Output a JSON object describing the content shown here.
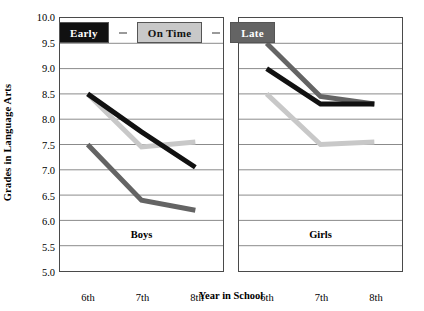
{
  "chart_data": {
    "type": "line",
    "title": "",
    "xlabel": "Year in School",
    "ylabel": "Grades in Language Arts",
    "categories": [
      "6th",
      "7th",
      "8th"
    ],
    "ylim": [
      5.0,
      10.0
    ],
    "yticks": [
      "5.0",
      "5.5",
      "6.0",
      "6.5",
      "7.0",
      "7.5",
      "8.0",
      "8.5",
      "9.0",
      "9.5",
      "10.0"
    ],
    "ytick_values": [
      5.0,
      5.5,
      6.0,
      6.5,
      7.0,
      7.5,
      8.0,
      8.5,
      9.0,
      9.5,
      10.0
    ],
    "grid": true,
    "legend_position": "top-left",
    "legend": [
      {
        "label": "Early",
        "color": "#111111",
        "text_color": "#ffffff"
      },
      {
        "label": "On Time",
        "color": "#c8c8c8",
        "text_color": "#111111"
      },
      {
        "label": "Late",
        "color": "#646464",
        "text_color": "#ffffff"
      }
    ],
    "panels": [
      {
        "name": "Boys",
        "label": "Boys",
        "series": [
          {
            "name": "Early",
            "color": "#111111",
            "values": [
              8.5,
              7.75,
              7.05
            ]
          },
          {
            "name": "On Time",
            "color": "#c8c8c8",
            "values": [
              8.5,
              7.45,
              7.55
            ]
          },
          {
            "name": "Late",
            "color": "#646464",
            "values": [
              7.5,
              6.4,
              6.2
            ]
          }
        ]
      },
      {
        "name": "Girls",
        "label": "Girls",
        "series": [
          {
            "name": "Early",
            "color": "#111111",
            "values": [
              9.0,
              8.3,
              8.3
            ]
          },
          {
            "name": "On Time",
            "color": "#c8c8c8",
            "values": [
              8.5,
              7.5,
              7.55
            ]
          },
          {
            "name": "Late",
            "color": "#646464",
            "values": [
              9.5,
              8.45,
              8.3
            ]
          }
        ]
      }
    ]
  }
}
